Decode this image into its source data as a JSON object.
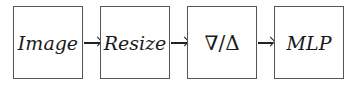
{
  "diagram": {
    "type": "pipeline",
    "nodes": [
      {
        "id": "image",
        "label": "Image"
      },
      {
        "id": "resize",
        "label": "Resize"
      },
      {
        "id": "grad",
        "label": "∇/Δ"
      },
      {
        "id": "mlp",
        "label": "MLP"
      }
    ],
    "edges": [
      {
        "from": "image",
        "to": "resize"
      },
      {
        "from": "resize",
        "to": "grad"
      },
      {
        "from": "grad",
        "to": "mlp"
      }
    ]
  }
}
